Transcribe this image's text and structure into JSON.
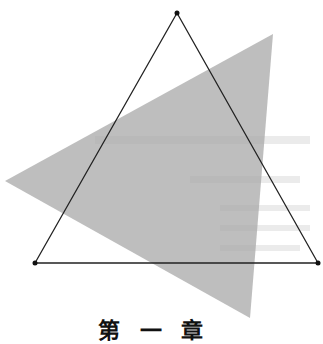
{
  "diagram": {
    "type": "geometry",
    "outline_triangle": {
      "vertices": [
        [
          177,
          13
        ],
        [
          35,
          263
        ],
        [
          318,
          263
        ]
      ],
      "stroke": "#222222",
      "vertex_dot_color": "#111111"
    },
    "shaded_triangle": {
      "vertices": [
        [
          5,
          181
        ],
        [
          273,
          34
        ],
        [
          250,
          318
        ]
      ],
      "fill": "#a8a8a8",
      "opacity": 0.75
    },
    "caption_partial": "第 一 章"
  },
  "colors": {
    "background": "#ffffff",
    "line": "#222222",
    "shade": "#a8a8a8"
  }
}
